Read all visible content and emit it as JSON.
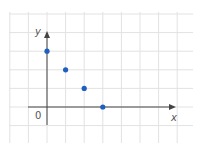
{
  "chart_data": {
    "type": "scatter",
    "title": "",
    "xlabel": "x",
    "ylabel": "y",
    "origin_label": "0",
    "points": [
      {
        "x": 0,
        "y": 3
      },
      {
        "x": 1,
        "y": 2
      },
      {
        "x": 2,
        "y": 1
      },
      {
        "x": 3,
        "y": 0
      }
    ],
    "x": [
      0,
      1,
      2,
      3
    ],
    "values": [
      3,
      2,
      1,
      0
    ],
    "xlim": [
      -2,
      8
    ],
    "ylim": [
      -2,
      5
    ],
    "grid": true,
    "legend": null,
    "tick_labels": false
  },
  "colors": {
    "grid": "#e2e2e2",
    "axis": "#444444",
    "point": "#1f5fbf",
    "label": "#555555"
  }
}
